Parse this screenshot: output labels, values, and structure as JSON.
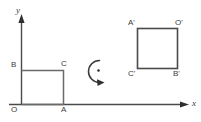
{
  "figure": {
    "kind": "geometry-diagram",
    "background_color": "#ffffff",
    "stroke_color": "#4a4a4a",
    "text_color": "#3b3b3b"
  },
  "axes": {
    "x_label": "x",
    "y_label": "y",
    "origin_label": "O"
  },
  "source_square": {
    "name": "OABC",
    "vertices": [
      {
        "label": "O",
        "position": "bottom-left"
      },
      {
        "label": "A",
        "position": "bottom-right"
      },
      {
        "label": "C",
        "position": "top-right"
      },
      {
        "label": "B",
        "position": "top-left"
      }
    ]
  },
  "rotation": {
    "marker": "counterclockwise-arc-arrow",
    "center_dot": "•"
  },
  "image_square": {
    "name": "A'O'B'C'",
    "vertices": [
      {
        "label": "A'",
        "position": "top-left"
      },
      {
        "label": "O'",
        "position": "top-right"
      },
      {
        "label": "B'",
        "position": "bottom-right"
      },
      {
        "label": "C'",
        "position": "bottom-left"
      }
    ]
  }
}
